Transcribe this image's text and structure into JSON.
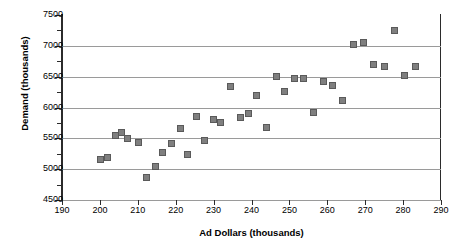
{
  "chart_data": {
    "type": "scatter",
    "title": "",
    "xlabel": "Ad Dollars (thousands)",
    "ylabel": "Demand (thousands)",
    "xlim": [
      190,
      290
    ],
    "ylim": [
      4500,
      7500
    ],
    "xticks": [
      190,
      200,
      210,
      220,
      230,
      240,
      250,
      260,
      270,
      280,
      290
    ],
    "yticks": [
      4500,
      5000,
      5500,
      6000,
      6500,
      7000,
      7500
    ],
    "grid": "horizontal",
    "legend": "none",
    "marker": "square",
    "marker_color": "#7f7f7f",
    "points": [
      {
        "x": 200.2,
        "y": 5160
      },
      {
        "x": 202.0,
        "y": 5190
      },
      {
        "x": 204.2,
        "y": 5545
      },
      {
        "x": 205.8,
        "y": 5590
      },
      {
        "x": 207.3,
        "y": 5505
      },
      {
        "x": 210.2,
        "y": 5440
      },
      {
        "x": 212.3,
        "y": 4870
      },
      {
        "x": 214.6,
        "y": 5050
      },
      {
        "x": 216.6,
        "y": 5265
      },
      {
        "x": 218.9,
        "y": 5415
      },
      {
        "x": 221.2,
        "y": 5665
      },
      {
        "x": 223.0,
        "y": 5245
      },
      {
        "x": 225.5,
        "y": 5855
      },
      {
        "x": 227.6,
        "y": 5460
      },
      {
        "x": 230.0,
        "y": 5805
      },
      {
        "x": 231.9,
        "y": 5760
      },
      {
        "x": 234.4,
        "y": 6345
      },
      {
        "x": 237.0,
        "y": 5845
      },
      {
        "x": 239.2,
        "y": 5910
      },
      {
        "x": 241.4,
        "y": 6190
      },
      {
        "x": 244.0,
        "y": 5670
      },
      {
        "x": 246.5,
        "y": 6500
      },
      {
        "x": 248.7,
        "y": 6265
      },
      {
        "x": 251.3,
        "y": 6475
      },
      {
        "x": 253.6,
        "y": 6475
      },
      {
        "x": 256.4,
        "y": 5920
      },
      {
        "x": 258.9,
        "y": 6425
      },
      {
        "x": 261.4,
        "y": 6350
      },
      {
        "x": 264.1,
        "y": 6120
      },
      {
        "x": 267.0,
        "y": 7020
      },
      {
        "x": 269.6,
        "y": 7055
      },
      {
        "x": 272.1,
        "y": 6700
      },
      {
        "x": 275.0,
        "y": 6670
      },
      {
        "x": 277.8,
        "y": 7255
      },
      {
        "x": 280.5,
        "y": 6515
      },
      {
        "x": 283.4,
        "y": 6660
      }
    ]
  }
}
